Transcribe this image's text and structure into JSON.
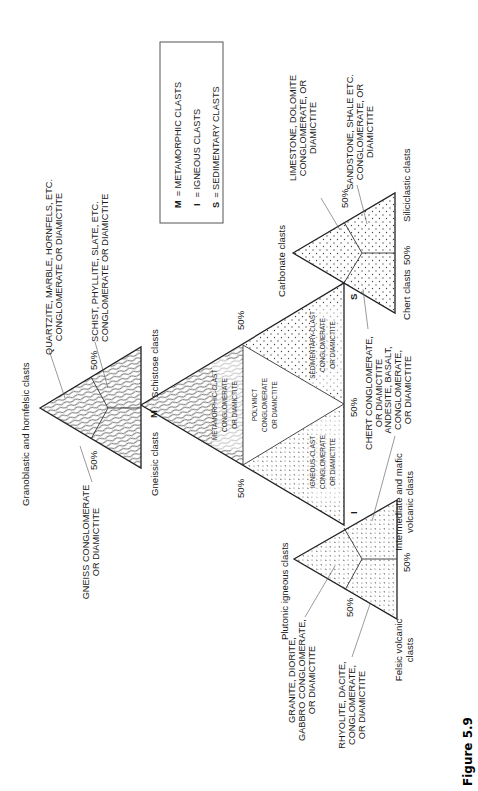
{
  "figure": {
    "caption": "Figure 5.9",
    "orientation": "rotated 90° counter-clockwise (text reads bottom-to-top)"
  },
  "legend": {
    "items": [
      {
        "symbol": "M",
        "label": "= METAMORPHIC CLASTS"
      },
      {
        "symbol": "I",
        "label": "= IGNEOUS CLASTS"
      },
      {
        "symbol": "S",
        "label": "= SEDIMENTARY CLASTS"
      }
    ]
  },
  "central_triangle": {
    "vertices": {
      "M": "M",
      "I": "I",
      "S": "S"
    },
    "fields": {
      "metamorphic": [
        "METAMORPHIC-CLAST",
        "CONGLOMERATE",
        "OR DIAMICTITE"
      ],
      "polymict": [
        "POLYMICT",
        "CONGLOMERATE",
        "OR DIAMICTITE"
      ],
      "igneous": [
        "IGNEOUS-CLAST",
        "CONGLOMERATE",
        "OR DIAMICTITE"
      ],
      "sedimentary": [
        "SEDIMENTARY-CLAST",
        "CONGLOMERATE",
        "OR DIAMICTITE"
      ]
    },
    "percent_labels": [
      "50%",
      "50%",
      "50%"
    ]
  },
  "metamorphic_triangle": {
    "apex_label": "Granoblastic and hornfelsic clasts",
    "left_label": "Gneissic clasts",
    "right_label": "Schistose clasts",
    "percent_labels": [
      "50%",
      "50%"
    ],
    "callouts": {
      "quartzite": [
        "QUARTZITE, MARBLE, HORNFELS, ETC.",
        "CONGLOMERATE OR DIAMICTITE"
      ],
      "schist": [
        "SCHIST, PHYLLITE, SLATE, ETC.",
        "CONGLOMERATE OR DIAMICTITE"
      ],
      "gneiss": [
        "GNEISS CONGLOMERATE",
        "OR DIAMICTITE"
      ]
    }
  },
  "sedimentary_triangle": {
    "apex_label": "Carbonate clasts",
    "left_label": "Chert clasts",
    "right_label": "Siliciclastic clasts",
    "percent_labels": [
      "50%",
      "50%"
    ],
    "callouts": {
      "limestone": [
        "LIMESTONE, DOLOMITE",
        "CONGLOMERATE, OR",
        "DIAMICTITE"
      ],
      "sandstone": [
        "SANDSTONE, SHALE ETC.",
        "CONGLOMERATE, OR",
        "DIAMICTITE"
      ],
      "chert": [
        "CHERT CONGLOMERATE,",
        "OR DIAMICTITE"
      ]
    }
  },
  "igneous_triangle": {
    "apex_label": "Plutonic igneous clasts",
    "left_label": [
      "Felsic volcanic",
      "clasts"
    ],
    "right_label": [
      "Intermediate and mafic",
      "volcanic clasts"
    ],
    "percent_labels": [
      "50%",
      "50%"
    ],
    "callouts": {
      "granite": [
        "GRANITE, DIORITE,",
        "GABBRO CONGLOMERATE,",
        "OR DIAMICTITE"
      ],
      "rhyolite": [
        "RHYOLITE, DACITE,",
        "CONGLOMERATE,",
        "OR DIAMICTITE"
      ],
      "andesite": [
        "ANDESITE, BASALT,",
        "CONGLOMERATE,",
        "OR DIAMICTITE"
      ]
    }
  },
  "colors": {
    "ink": "#1a1a1a",
    "background": "#ffffff",
    "pattern_stroke": "#444444"
  }
}
